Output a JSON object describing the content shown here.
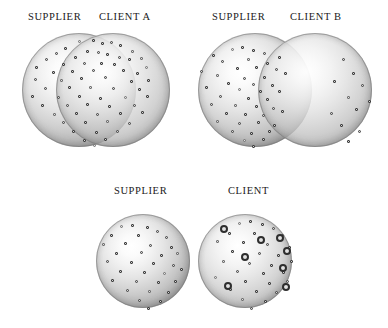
{
  "figure": {
    "background": "#ffffff",
    "width": 388,
    "height": 328,
    "dot_color": "#3c3c3c",
    "ring_color": "#2e2e2e",
    "sphere_fill": "#d2d2d2"
  },
  "panels": [
    {
      "id": "panel-client-a",
      "name": "supplier-client-a",
      "labels": [
        {
          "text": "SUPPLIER",
          "x": 28,
          "y": 12
        },
        {
          "text": "CLIENT A",
          "x": 99,
          "y": 12
        }
      ],
      "circles": [
        {
          "role": "supplier",
          "cx": 79,
          "cy": 90,
          "r": 57
        },
        {
          "role": "client",
          "cx": 113,
          "cy": 90,
          "r": 57
        }
      ],
      "overlap": "large",
      "dots": [
        [
          78,
          40
        ],
        [
          92,
          39
        ],
        [
          101,
          42
        ],
        [
          110,
          41
        ],
        [
          119,
          44
        ],
        [
          64,
          47
        ],
        [
          55,
          52
        ],
        [
          131,
          50
        ],
        [
          86,
          50
        ],
        [
          97,
          51
        ],
        [
          106,
          53
        ],
        [
          74,
          56
        ],
        [
          118,
          56
        ],
        [
          128,
          58
        ],
        [
          140,
          57
        ],
        [
          45,
          58
        ],
        [
          35,
          66
        ],
        [
          62,
          63
        ],
        [
          83,
          62
        ],
        [
          100,
          62
        ],
        [
          113,
          63
        ],
        [
          145,
          66
        ],
        [
          52,
          71
        ],
        [
          71,
          70
        ],
        [
          92,
          69
        ],
        [
          122,
          69
        ],
        [
          136,
          72
        ],
        [
          34,
          78
        ],
        [
          60,
          79
        ],
        [
          80,
          77
        ],
        [
          104,
          76
        ],
        [
          130,
          80
        ],
        [
          147,
          79
        ],
        [
          44,
          87
        ],
        [
          68,
          86
        ],
        [
          89,
          86
        ],
        [
          112,
          87
        ],
        [
          138,
          88
        ],
        [
          31,
          95
        ],
        [
          57,
          96
        ],
        [
          78,
          95
        ],
        [
          99,
          97
        ],
        [
          124,
          96
        ],
        [
          146,
          95
        ],
        [
          41,
          104
        ],
        [
          66,
          104
        ],
        [
          86,
          103
        ],
        [
          108,
          105
        ],
        [
          133,
          104
        ],
        [
          53,
          113
        ],
        [
          75,
          112
        ],
        [
          96,
          113
        ],
        [
          119,
          112
        ],
        [
          141,
          111
        ],
        [
          62,
          121
        ],
        [
          84,
          121
        ],
        [
          106,
          120
        ],
        [
          128,
          122
        ],
        [
          72,
          130
        ],
        [
          95,
          131
        ],
        [
          116,
          130
        ],
        [
          83,
          139
        ],
        [
          104,
          138
        ],
        [
          93,
          144
        ]
      ],
      "ringed_dots": []
    },
    {
      "id": "panel-client-b",
      "name": "supplier-client-b",
      "labels": [
        {
          "text": "SUPPLIER",
          "x": 212,
          "y": 12
        },
        {
          "text": "CLIENT B",
          "x": 290,
          "y": 12
        }
      ],
      "circles": [
        {
          "role": "supplier",
          "cx": 255,
          "cy": 90,
          "r": 57
        },
        {
          "role": "client",
          "cx": 315,
          "cy": 90,
          "r": 57
        }
      ],
      "overlap": "small",
      "dots": [
        [
          231,
          48
        ],
        [
          241,
          46
        ],
        [
          252,
          49
        ],
        [
          263,
          52
        ],
        [
          278,
          56
        ],
        [
          212,
          54
        ],
        [
          221,
          60
        ],
        [
          247,
          58
        ],
        [
          266,
          62
        ],
        [
          200,
          70
        ],
        [
          236,
          67
        ],
        [
          255,
          66
        ],
        [
          275,
          68
        ],
        [
          284,
          72
        ],
        [
          216,
          74
        ],
        [
          243,
          77
        ],
        [
          263,
          76
        ],
        [
          227,
          82
        ],
        [
          252,
          83
        ],
        [
          271,
          84
        ],
        [
          205,
          86
        ],
        [
          238,
          88
        ],
        [
          259,
          90
        ],
        [
          278,
          90
        ],
        [
          219,
          95
        ],
        [
          247,
          97
        ],
        [
          266,
          98
        ],
        [
          210,
          103
        ],
        [
          234,
          104
        ],
        [
          255,
          105
        ],
        [
          272,
          107
        ],
        [
          225,
          112
        ],
        [
          244,
          113
        ],
        [
          262,
          114
        ],
        [
          281,
          110
        ],
        [
          216,
          120
        ],
        [
          238,
          122
        ],
        [
          257,
          121
        ],
        [
          273,
          124
        ],
        [
          231,
          130
        ],
        [
          250,
          132
        ],
        [
          268,
          130
        ],
        [
          243,
          139
        ],
        [
          262,
          138
        ],
        [
          252,
          145
        ],
        [
          342,
          58
        ],
        [
          352,
          72
        ],
        [
          333,
          80
        ],
        [
          361,
          84
        ],
        [
          347,
          96
        ],
        [
          355,
          108
        ],
        [
          330,
          112
        ],
        [
          368,
          100
        ],
        [
          340,
          124
        ],
        [
          358,
          130
        ],
        [
          347,
          140
        ]
      ],
      "ringed_dots": []
    },
    {
      "id": "panel-client-plain",
      "name": "supplier-client",
      "labels": [
        {
          "text": "SUPPLIER",
          "x": 114,
          "y": 186
        },
        {
          "text": "CLIENT",
          "x": 228,
          "y": 186
        }
      ],
      "circles": [
        {
          "role": "supplier",
          "cx": 143,
          "cy": 261,
          "r": 47
        },
        {
          "role": "client",
          "cx": 245,
          "cy": 261,
          "r": 47
        }
      ],
      "overlap": "none",
      "dots": [
        [
          120,
          225
        ],
        [
          131,
          224
        ],
        [
          146,
          226
        ],
        [
          156,
          230
        ],
        [
          110,
          234
        ],
        [
          137,
          234
        ],
        [
          165,
          236
        ],
        [
          102,
          243
        ],
        [
          124,
          242
        ],
        [
          149,
          244
        ],
        [
          170,
          246
        ],
        [
          115,
          252
        ],
        [
          140,
          251
        ],
        [
          160,
          254
        ],
        [
          176,
          252
        ],
        [
          106,
          260
        ],
        [
          130,
          261
        ],
        [
          152,
          262
        ],
        [
          172,
          264
        ],
        [
          119,
          270
        ],
        [
          143,
          271
        ],
        [
          163,
          272
        ],
        [
          180,
          268
        ],
        [
          111,
          279
        ],
        [
          135,
          280
        ],
        [
          157,
          281
        ],
        [
          174,
          280
        ],
        [
          126,
          289
        ],
        [
          148,
          290
        ],
        [
          167,
          291
        ],
        [
          138,
          299
        ],
        [
          159,
          300
        ],
        [
          147,
          307
        ]
      ],
      "ringed_dots": []
    },
    {
      "id": "panel-client-highlight",
      "name": "client-highlighted",
      "labels": [],
      "circles": [],
      "overlap": "none",
      "dots": [
        [
          238,
          222
        ],
        [
          249,
          220
        ],
        [
          261,
          223
        ],
        [
          272,
          227
        ],
        [
          228,
          232
        ],
        [
          253,
          232
        ],
        [
          281,
          234
        ],
        [
          216,
          240
        ],
        [
          242,
          241
        ],
        [
          266,
          243
        ],
        [
          288,
          246
        ],
        [
          231,
          250
        ],
        [
          258,
          252
        ],
        [
          277,
          254
        ],
        [
          222,
          260
        ],
        [
          248,
          262
        ],
        [
          270,
          264
        ],
        [
          290,
          260
        ],
        [
          236,
          270
        ],
        [
          262,
          272
        ],
        [
          282,
          271
        ],
        [
          214,
          276
        ],
        [
          244,
          280
        ],
        [
          268,
          282
        ],
        [
          286,
          280
        ],
        [
          229,
          288
        ],
        [
          255,
          290
        ],
        [
          275,
          291
        ],
        [
          241,
          298
        ],
        [
          264,
          300
        ],
        [
          250,
          307
        ]
      ],
      "ringed_dots": [
        [
          222,
          227
        ],
        [
          278,
          236
        ],
        [
          243,
          255
        ],
        [
          285,
          249
        ],
        [
          226,
          284
        ],
        [
          281,
          266
        ],
        [
          284,
          285
        ],
        [
          259,
          238
        ]
      ]
    }
  ]
}
